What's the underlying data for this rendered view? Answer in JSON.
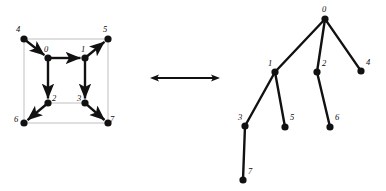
{
  "figure": {
    "background_color": "#ffffff",
    "ink_color": "#111111",
    "frame_color": "#b9b9b9"
  },
  "left_graph": {
    "name": "cube-graph",
    "description": "Cube drawn as nested squares with bold directed spanning-tree edges",
    "nodes": [
      {
        "id": "0",
        "label": "0",
        "x": 48,
        "y": 58,
        "label_x": 44,
        "label_y": 52
      },
      {
        "id": "1",
        "label": "1",
        "x": 85,
        "y": 58,
        "label_x": 81,
        "label_y": 52
      },
      {
        "id": "2",
        "label": "2",
        "x": 48,
        "y": 103,
        "label_x": 52,
        "label_y": 101
      },
      {
        "id": "3",
        "label": "3",
        "x": 85,
        "y": 103,
        "label_x": 77,
        "label_y": 101
      },
      {
        "id": "4",
        "label": "4",
        "x": 24,
        "y": 39,
        "label_x": 16,
        "label_y": 32
      },
      {
        "id": "5",
        "label": "5",
        "x": 108,
        "y": 39,
        "label_x": 103,
        "label_y": 32
      },
      {
        "id": "6",
        "label": "6",
        "x": 24,
        "y": 123,
        "label_x": 14,
        "label_y": 122
      },
      {
        "id": "7",
        "label": "7",
        "x": 108,
        "y": 123,
        "label_x": 110,
        "label_y": 122
      }
    ],
    "frame_edges": [
      {
        "from": "4",
        "to": "5",
        "style": "thin-gray"
      },
      {
        "from": "5",
        "to": "7",
        "style": "thin-gray"
      },
      {
        "from": "7",
        "to": "6",
        "style": "thin-gray"
      },
      {
        "from": "6",
        "to": "4",
        "style": "thin-gray"
      },
      {
        "from": "0",
        "to": "1",
        "style": "thin-gray"
      },
      {
        "from": "1",
        "to": "3",
        "style": "thin-gray"
      },
      {
        "from": "3",
        "to": "2",
        "style": "thin-gray"
      },
      {
        "from": "2",
        "to": "0",
        "style": "thin-gray"
      }
    ],
    "directed_edges": [
      {
        "from": "0",
        "to": "1",
        "style": "bold-arrow"
      },
      {
        "from": "0",
        "to": "2",
        "style": "bold-arrow"
      },
      {
        "from": "1",
        "to": "3",
        "style": "bold-arrow"
      },
      {
        "from": "4",
        "to": "0",
        "style": "bold-arrow"
      },
      {
        "from": "1",
        "to": "5",
        "style": "bold-arrow"
      },
      {
        "from": "2",
        "to": "6",
        "style": "bold-arrow"
      },
      {
        "from": "3",
        "to": "7",
        "style": "bold-arrow"
      }
    ],
    "node_radius": 3.6
  },
  "equivalence_arrow": {
    "name": "double-headed-arrow",
    "x1": 150,
    "x2": 220,
    "y": 78,
    "heads": "both"
  },
  "right_tree": {
    "name": "spanning-tree",
    "description": "Rooted tree representation of the spanning tree",
    "root": "0",
    "nodes": [
      {
        "id": "0",
        "label": "0",
        "x": 325,
        "y": 19,
        "label_x": 322,
        "label_y": 12
      },
      {
        "id": "1",
        "label": "1",
        "x": 275,
        "y": 72,
        "label_x": 268,
        "label_y": 66
      },
      {
        "id": "2",
        "label": "2",
        "x": 317,
        "y": 72,
        "label_x": 322,
        "label_y": 66
      },
      {
        "id": "4",
        "label": "4",
        "x": 361,
        "y": 71,
        "label_x": 366,
        "label_y": 65
      },
      {
        "id": "3",
        "label": "3",
        "x": 245,
        "y": 126,
        "label_x": 238,
        "label_y": 120
      },
      {
        "id": "5",
        "label": "5",
        "x": 285,
        "y": 127,
        "label_x": 290,
        "label_y": 120
      },
      {
        "id": "6",
        "label": "6",
        "x": 330,
        "y": 127,
        "label_x": 335,
        "label_y": 120
      },
      {
        "id": "7",
        "label": "7",
        "x": 243,
        "y": 180,
        "label_x": 248,
        "label_y": 174
      }
    ],
    "edges": [
      {
        "from": "0",
        "to": "1"
      },
      {
        "from": "0",
        "to": "2"
      },
      {
        "from": "0",
        "to": "4"
      },
      {
        "from": "1",
        "to": "3"
      },
      {
        "from": "1",
        "to": "5"
      },
      {
        "from": "2",
        "to": "6"
      },
      {
        "from": "3",
        "to": "7"
      }
    ],
    "node_radius": 3.6
  }
}
